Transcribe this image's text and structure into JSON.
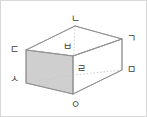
{
  "figure": {
    "name": "cuboid-vertex-diagram",
    "type": "3d-rectangular-prism",
    "canvas": {
      "width": 147,
      "height": 117
    },
    "colors": {
      "background": "#ffffff",
      "border": "#d8d8d8",
      "edge_visible": "#9a9a9a",
      "edge_hidden": "#c9c9c9",
      "face_shaded_fill": "#cfcfcf",
      "face_top_fill": "#ffffff",
      "label_text": "#3a3a3a"
    },
    "shaded_face": "front-left",
    "hidden_edges_style": "dotted"
  },
  "vertices": [
    {
      "id": "g",
      "label": "ㄱ",
      "name": "vertex-label-g",
      "x": 126,
      "y": 33,
      "position": "top-right-front"
    },
    {
      "id": "n",
      "label": "ㄴ",
      "name": "vertex-label-n",
      "x": 70,
      "y": 13,
      "position": "top-rear"
    },
    {
      "id": "d",
      "label": "ㄷ",
      "name": "vertex-label-d",
      "x": 9,
      "y": 44,
      "position": "top-left"
    },
    {
      "id": "r",
      "label": "ㄹ",
      "name": "vertex-label-r",
      "x": 76,
      "y": 63,
      "position": "center-lower"
    },
    {
      "id": "m",
      "label": "ㅁ",
      "name": "vertex-label-m",
      "x": 126,
      "y": 64,
      "position": "right-middle"
    },
    {
      "id": "b",
      "label": "ㅂ",
      "name": "vertex-label-b",
      "x": 62,
      "y": 41,
      "position": "center-upper"
    },
    {
      "id": "s",
      "label": "ㅅ",
      "name": "vertex-label-s",
      "x": 9,
      "y": 73,
      "position": "bottom-left"
    },
    {
      "id": "o",
      "label": "ㅇ",
      "name": "vertex-label-o",
      "x": 70,
      "y": 99,
      "position": "bottom-front"
    }
  ],
  "geometry": {
    "points": {
      "n": {
        "x": 74,
        "y": 25
      },
      "g": {
        "x": 121,
        "y": 38
      },
      "d": {
        "x": 25,
        "y": 49
      },
      "b": {
        "x": 72,
        "y": 55
      },
      "m": {
        "x": 121,
        "y": 69
      },
      "r": {
        "x": 72,
        "y": 74
      },
      "s": {
        "x": 25,
        "y": 82
      },
      "o": {
        "x": 72,
        "y": 93
      }
    },
    "faces": {
      "top": [
        "n",
        "g",
        "b",
        "d"
      ],
      "front_left": [
        "d",
        "b",
        "o",
        "s"
      ],
      "front_right": [
        "b",
        "g",
        "m",
        "o"
      ]
    },
    "edges_visible": [
      [
        "n",
        "g"
      ],
      [
        "n",
        "d"
      ],
      [
        "d",
        "b"
      ],
      [
        "b",
        "g"
      ],
      [
        "d",
        "s"
      ],
      [
        "g",
        "m"
      ],
      [
        "b",
        "o"
      ],
      [
        "s",
        "o"
      ],
      [
        "o",
        "m"
      ]
    ],
    "edges_hidden": [
      [
        "n",
        "r"
      ],
      [
        "r",
        "s"
      ],
      [
        "r",
        "m"
      ],
      [
        "r",
        "o"
      ]
    ]
  }
}
